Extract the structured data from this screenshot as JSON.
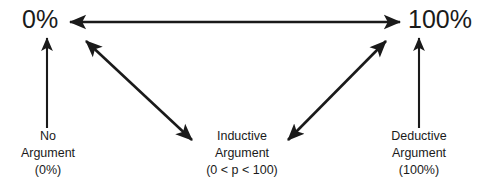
{
  "diagram": {
    "stroke_color": "#1a1a1a",
    "background_color": "#ffffff",
    "scale": {
      "min_label": "0%",
      "max_label": "100%"
    },
    "nodes": [
      {
        "id": "no-argument",
        "line1": "No",
        "line2": "Argument",
        "line3": "(0%)"
      },
      {
        "id": "inductive-argument",
        "line1": "Inductive",
        "line2": "Argument",
        "line3": "(0 < p < 100)"
      },
      {
        "id": "deductive-argument",
        "line1": "Deductive",
        "line2": "Argument",
        "line3": "(100%)"
      }
    ],
    "connectors": [
      {
        "id": "scale-axis",
        "name": "horizontal-double-arrow",
        "from": "0%",
        "to": "100%",
        "heads": "both"
      },
      {
        "id": "zero-to-no-argument",
        "name": "vertical-arrow-left",
        "from": "No Argument (0%)",
        "to": "0%",
        "heads": "end"
      },
      {
        "id": "hundred-to-deductive-argument",
        "name": "vertical-arrow-right",
        "from": "Deductive Argument (100%)",
        "to": "100%",
        "heads": "end"
      },
      {
        "id": "zero-to-inductive",
        "name": "diagonal-double-arrow-left",
        "from": "0%",
        "to": "Inductive Argument",
        "heads": "both"
      },
      {
        "id": "hundred-to-inductive",
        "name": "diagonal-double-arrow-right",
        "from": "100%",
        "to": "Inductive Argument",
        "heads": "both"
      }
    ]
  }
}
